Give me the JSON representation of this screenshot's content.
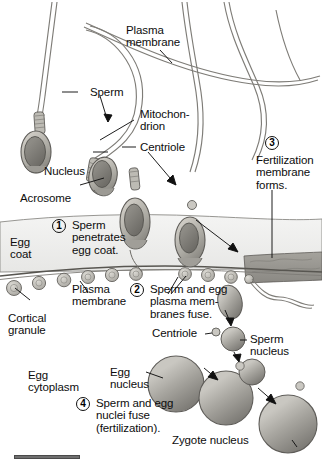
{
  "figure": {
    "background": "#ffffff",
    "ink": "#0d0d0d"
  },
  "palette": {
    "egg_coat": "#f0f0ef",
    "egg_cytoplasm": "#ffffff",
    "fertilization_membrane_band": "#9a9892",
    "sperm_head_fill": "#b9b7b0",
    "nucleus_fill": "#8e8c86",
    "granule_fill": "#cfcdc7",
    "outline": "#5e5c58",
    "nucleus_sphere": "#9e9c96",
    "rule": "#6f6f6f"
  },
  "labels": {
    "plasma_membrane_top": "Plasma\nmembrane",
    "sperm": "Sperm",
    "mitochondrion": "Mitochon-\ndrion",
    "centriole_top": "Centriole",
    "nucleus": "Nucleus",
    "acrosome": "Acrosome",
    "egg_coat": "Egg\ncoat",
    "plasma_membrane_bottom": "Plasma\nmembrane",
    "cortical_granule": "Cortical\ngranule",
    "egg_cytoplasm": "Egg\ncytoplasm",
    "centriole_lower": "Centriole",
    "sperm_nucleus": "Sperm\nnucleus",
    "egg_nucleus": "Egg\nnucleus",
    "zygote_nucleus": "Zygote nucleus"
  },
  "steps": [
    {
      "number": "1",
      "text": "Sperm\npenetrates\negg coat."
    },
    {
      "number": "2",
      "text": "Sperm and egg\nplasma mem-\nbranes fuse."
    },
    {
      "number": "3",
      "text": "Fertilization\nmembrane\nforms."
    },
    {
      "number": "4",
      "text": "Sperm and egg\nnuclei fuse\n(fertilization)."
    }
  ],
  "structures": {
    "sperm_cells": 4,
    "cortical_granules": 12,
    "nuclei_stages": [
      "sperm nucleus",
      "egg nucleus",
      "fusing nuclei",
      "zygote nucleus"
    ]
  }
}
